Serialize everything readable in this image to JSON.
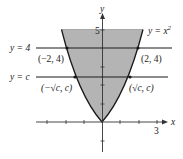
{
  "diagram": {
    "axes": {
      "x_label": "x",
      "y_label": "y",
      "x_tick_label": "3",
      "y_tick_label": "5"
    },
    "curve": {
      "label": "y = x",
      "exponent": "2",
      "equation": "y = x^2"
    },
    "lines": [
      {
        "label": "y = 4",
        "y_value": "4"
      },
      {
        "label": "y = c",
        "y_value": "c"
      }
    ],
    "points": [
      {
        "label": "(−2, 4)"
      },
      {
        "label": "(2, 4)"
      },
      {
        "label": "(−√c, c)"
      },
      {
        "label": "(√c, c)"
      }
    ],
    "colors": {
      "shade": "#b4b4b4",
      "stroke": "#1a1a1a"
    }
  }
}
